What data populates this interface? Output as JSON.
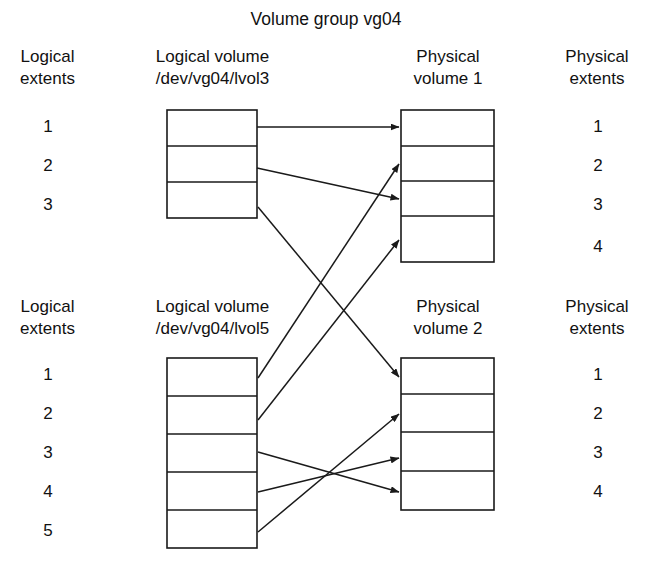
{
  "title": "Volume group vg04",
  "groups": [
    {
      "id": "upper",
      "left_header_line1": "Logical",
      "left_header_line2": "extents",
      "lv_header_line1": "Logical volume",
      "lv_header_line2": "/dev/vg04/lvol3",
      "pv_header_line1": "Physical",
      "pv_header_line2": "volume 1",
      "right_header_line1": "Physical",
      "right_header_line2": "extents",
      "logical_extents": [
        "1",
        "2",
        "3"
      ],
      "physical_extents": [
        "1",
        "2",
        "3",
        "4"
      ]
    },
    {
      "id": "lower",
      "left_header_line1": "Logical",
      "left_header_line2": "extents",
      "lv_header_line1": "Logical volume",
      "lv_header_line2": "/dev/vg04/lvol5",
      "pv_header_line1": "Physical",
      "pv_header_line2": "volume 2",
      "right_header_line1": "Physical",
      "right_header_line2": "extents",
      "logical_extents": [
        "1",
        "2",
        "3",
        "4",
        "5"
      ],
      "physical_extents": [
        "1",
        "2",
        "3",
        "4"
      ]
    }
  ],
  "mappings": [
    {
      "from": "lvol3 extent 1",
      "to": "physical volume 1 extent 1"
    },
    {
      "from": "lvol3 extent 2",
      "to": "physical volume 1 extent 3"
    },
    {
      "from": "lvol3 extent 3",
      "to": "physical volume 2 extent 1"
    },
    {
      "from": "lvol5 extent 1",
      "to": "physical volume 1 extent 2"
    },
    {
      "from": "lvol5 extent 2",
      "to": "physical volume 1 extent 4"
    },
    {
      "from": "lvol5 extent 3",
      "to": "physical volume 2 extent 4"
    },
    {
      "from": "lvol5 extent 4",
      "to": "physical volume 2 extent 3"
    },
    {
      "from": "lvol5 extent 5",
      "to": "physical volume 2 extent 2"
    }
  ],
  "colors": {
    "stroke": "#1a1a1a",
    "background": "#ffffff",
    "text": "#111111"
  }
}
